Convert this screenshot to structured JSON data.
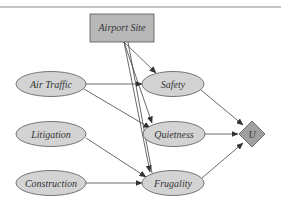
{
  "diagram": {
    "title_rule": true,
    "colors": {
      "node_fill": "#d3d3d3",
      "decision_fill": "#b8b8b8",
      "utility_fill": "#a0a0a0",
      "stroke": "#555555",
      "edge": "#444444"
    },
    "nodes": [
      {
        "id": "airport_site",
        "label": "Airport Site",
        "shape": "rectangle",
        "kind": "decision"
      },
      {
        "id": "air_traffic",
        "label": "Air Traffic",
        "shape": "ellipse",
        "kind": "chance"
      },
      {
        "id": "litigation",
        "label": "Litigation",
        "shape": "ellipse",
        "kind": "chance"
      },
      {
        "id": "construction",
        "label": "Construction",
        "shape": "ellipse",
        "kind": "chance"
      },
      {
        "id": "safety",
        "label": "Safety",
        "shape": "ellipse",
        "kind": "chance"
      },
      {
        "id": "quietness",
        "label": "Quietness",
        "shape": "ellipse",
        "kind": "chance"
      },
      {
        "id": "frugality",
        "label": "Frugality",
        "shape": "ellipse",
        "kind": "chance"
      },
      {
        "id": "utility",
        "label": "U",
        "shape": "diamond",
        "kind": "utility"
      }
    ],
    "edges": [
      {
        "from": "airport_site",
        "to": "safety"
      },
      {
        "from": "airport_site",
        "to": "quietness"
      },
      {
        "from": "airport_site",
        "to": "frugality"
      },
      {
        "from": "air_traffic",
        "to": "safety"
      },
      {
        "from": "air_traffic",
        "to": "quietness"
      },
      {
        "from": "litigation",
        "to": "frugality"
      },
      {
        "from": "construction",
        "to": "frugality"
      },
      {
        "from": "safety",
        "to": "utility"
      },
      {
        "from": "quietness",
        "to": "utility"
      },
      {
        "from": "frugality",
        "to": "utility"
      }
    ]
  }
}
